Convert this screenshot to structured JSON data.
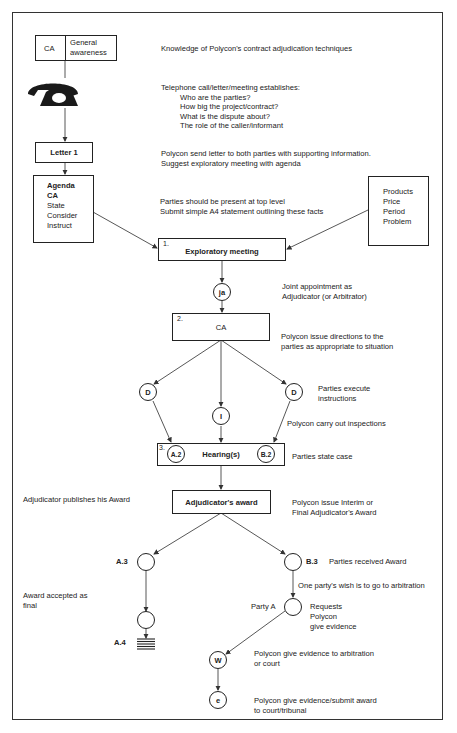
{
  "ca_box": {
    "left": "CA",
    "right_line1": "General",
    "right_line2": "awareness"
  },
  "notes": {
    "knowledge": "Knowledge of Polycon's contract adjudication techniques",
    "telephone_heading": "Telephone call/letter/meeting establishes:",
    "telephone_items": [
      "Who are the parties?",
      "How big the project/contract?",
      "What is the dispute about?",
      "The role of the caller/informant"
    ],
    "letter_line1": "Polycon send letter to both parties with supporting information.",
    "letter_line2": "Suggest exploratory meeting with agenda",
    "parties_line1": "Parties should be present at top level",
    "parties_line2": "Submit simple A4 statement outlining these facts",
    "joint_line1": "Joint appointment as",
    "joint_line2": "Adjudicator (or Arbitrator)",
    "directions_line1": "Polycon issue directions to the",
    "directions_line2": "parties as appropriate to situation",
    "execute_line1": "Parties execute",
    "execute_line2": "instructions",
    "inspections": "Polycon carry out inspections",
    "state_case": "Parties state case",
    "publishes": "Adjudicator publishes his Award",
    "interim_line1": "Polycon issue Interim or",
    "interim_line2": "Final Adjudicator's Award",
    "received": "Parties received Award",
    "wish": "One party's wish is to go to arbitration",
    "accepted_line1": "Award accepted as",
    "accepted_line2": "final",
    "requests_line1": "Requests",
    "requests_line2": "Polycon",
    "requests_line3": "give evidence",
    "evidence_line1": "Polycon give evidence to arbitration",
    "evidence_line2": "or court",
    "submit_line1": "Polycon give evidence/submit award",
    "submit_line2": "to court/tribunal"
  },
  "letter_box": "Letter 1",
  "agenda_box": {
    "title1": "Agenda",
    "title2": "CA",
    "items": [
      "State",
      "Consider",
      "Instruct"
    ]
  },
  "products_box": {
    "items": [
      "Products",
      "Price",
      "Period",
      "Problem"
    ]
  },
  "exploratory": {
    "num": "1.",
    "label": "Exploratory meeting"
  },
  "ja_node": "ja",
  "ca_step": {
    "num": "2.",
    "label": "CA"
  },
  "d_left": "D",
  "i_node": "I",
  "d_right": "D",
  "hearing": {
    "num": "3.",
    "label": "Hearing(s)",
    "a_node": "A.2",
    "b_node": "B.2"
  },
  "award_box": "Adjudicator's award",
  "labels": {
    "a3": "A.3",
    "b3": "B.3",
    "a4": "A.4",
    "party_a": "Party A"
  },
  "w_node": "W",
  "e_node": "e",
  "icons": {
    "telephone": "telephone-icon",
    "terminal": "end-bars-icon"
  }
}
